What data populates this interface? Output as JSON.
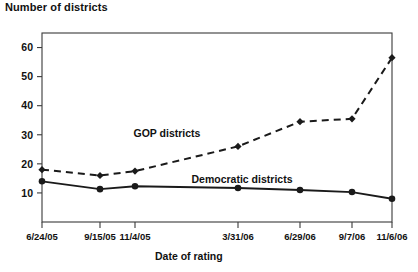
{
  "chart_data": {
    "type": "line",
    "title": "Number of districts",
    "xlabel": "Date of rating",
    "ylabel": "",
    "categories": [
      "6/24/05",
      "9/15/05",
      "11/4/05",
      "3/31/06",
      "6/29/06",
      "9/7/06",
      "11/6/06"
    ],
    "ylim": [
      0,
      65
    ],
    "yticks": [
      10,
      20,
      30,
      40,
      50,
      60
    ],
    "ytick_labels": [
      "10",
      "20",
      "30",
      "40",
      "50",
      "60"
    ],
    "grid": false,
    "legend": "inline-annotations",
    "series": [
      {
        "name": "GOP districts",
        "style": "dashed",
        "marker": "diamond",
        "color": "#1a1a1a",
        "values": [
          18,
          16,
          17.5,
          26,
          34.5,
          35.5,
          56.5
        ]
      },
      {
        "name": "Democratic districts",
        "style": "solid",
        "marker": "circle",
        "color": "#1a1a1a",
        "values": [
          14,
          11.3,
          12.3,
          11.7,
          11,
          10.3,
          8
        ]
      }
    ],
    "annotations": [
      {
        "text": "GOP districts",
        "x": 167,
        "y": 137
      },
      {
        "text": "Democratic districts",
        "x": 242,
        "y": 183
      }
    ]
  }
}
